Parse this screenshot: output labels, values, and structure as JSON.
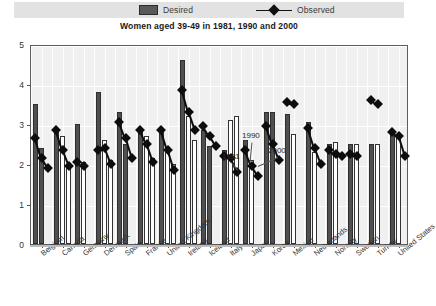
{
  "legend": {
    "desired_label": "Desired",
    "observed_label": "Observed",
    "desired_color": "#5a5a5a",
    "observed_color": "#111111",
    "background": "#e2e2e2"
  },
  "title": "Women aged 39-49 in 1981, 1990 and 2000",
  "annotations": [
    {
      "text": "1981"
    },
    {
      "text": "1990"
    },
    {
      "text": "2000"
    }
  ],
  "chart_data": {
    "type": "bar",
    "title": "Women aged 39-49 in 1981, 1990 and 2000",
    "xlabel": "",
    "ylabel": "",
    "ylim": [
      0,
      5
    ],
    "yticks": [
      0,
      1,
      2,
      3,
      4,
      5
    ],
    "ytick_labels": [
      "0",
      "1",
      "2",
      "3",
      "4",
      "5"
    ],
    "grid": true,
    "legend_position": "top",
    "categories": [
      "Belgium",
      "Canada",
      "Germany",
      "Denmark",
      "Spain",
      "France",
      "United Kingdom",
      "Ireland",
      "Iceland",
      "Italy",
      "Japan",
      "Korea",
      "Mexico",
      "Netherlands",
      "Norway",
      "Sweden",
      "Turkey",
      "United States"
    ],
    "subgroups": [
      "1981",
      "1990",
      "2000"
    ],
    "series": [
      {
        "name": "Desired",
        "note": "bars; filled dark = 1981 and 1990 where shown, open/white = 2000",
        "values": [
          [
            3.5,
            2.4,
            null
          ],
          [
            2.8,
            2.7,
            2.0
          ],
          [
            3.0,
            2.05,
            null
          ],
          [
            3.8,
            2.6,
            2.1
          ],
          [
            3.3,
            2.5,
            null
          ],
          [
            2.9,
            2.7,
            2.15
          ],
          [
            2.8,
            2.3,
            2.0
          ],
          [
            4.6,
            3.2,
            2.6
          ],
          [
            2.85,
            2.45,
            null
          ],
          [
            2.35,
            3.1,
            3.2
          ],
          [
            2.6,
            2.1,
            null
          ],
          [
            3.3,
            3.3,
            null
          ],
          [
            3.25,
            2.75,
            null
          ],
          [
            3.05,
            2.3,
            null
          ],
          [
            2.5,
            2.55,
            null
          ],
          [
            2.5,
            2.5,
            null
          ],
          [
            2.5,
            2.5,
            null
          ],
          [
            2.85,
            2.75,
            null
          ]
        ]
      },
      {
        "name": "Observed",
        "note": "diamond markers joined by short segments; value per subgroup year",
        "values": [
          [
            2.7,
            2.2,
            1.95
          ],
          [
            2.9,
            2.4,
            2.0
          ],
          [
            2.1,
            2.0,
            null
          ],
          [
            2.4,
            2.45,
            2.05
          ],
          [
            3.1,
            2.7,
            2.2
          ],
          [
            2.9,
            2.55,
            2.1
          ],
          [
            2.9,
            2.4,
            1.9
          ],
          [
            3.9,
            3.35,
            2.9
          ],
          [
            3.0,
            2.75,
            2.5
          ],
          [
            2.25,
            2.2,
            1.85
          ],
          [
            2.4,
            2.0,
            1.75
          ],
          [
            3.0,
            2.55,
            2.15
          ],
          [
            3.6,
            3.55,
            null
          ],
          [
            2.95,
            2.45,
            2.05
          ],
          [
            2.4,
            2.3,
            2.25
          ],
          [
            2.3,
            2.25,
            null
          ],
          [
            3.65,
            3.55,
            null
          ],
          [
            2.85,
            2.75,
            2.25
          ]
        ]
      }
    ]
  }
}
